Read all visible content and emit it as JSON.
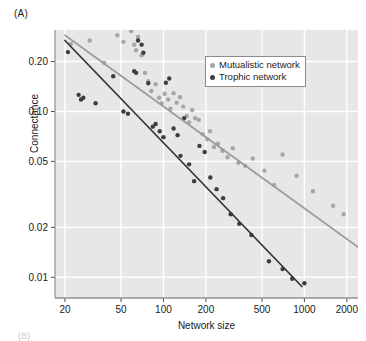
{
  "figure": {
    "panel_label": "(A)",
    "next_panel_stub": "(B)"
  },
  "legend": {
    "position": "top-right-inside",
    "entries": [
      {
        "label": "Mutualistic network",
        "color": "#a6a6a6",
        "marker": "circle"
      },
      {
        "label": "Trophic network",
        "color": "#3d3d3d",
        "marker": "circle"
      }
    ]
  },
  "chart_data": {
    "type": "scatter",
    "title": "",
    "xlabel": "Network size",
    "ylabel": "Connectance",
    "xscale": "log",
    "yscale": "log",
    "xlim": [
      17,
      2400
    ],
    "ylim": [
      0.0075,
      0.31
    ],
    "grid": true,
    "grid_color": "#ffffff",
    "plot_background": "#e7e7e7",
    "xticks": [
      20,
      50,
      100,
      200,
      500,
      1000,
      2000
    ],
    "xticklabels": [
      "20",
      "50",
      "100",
      "200",
      "500",
      "1000",
      "2000"
    ],
    "yticks": [
      0.01,
      0.02,
      0.05,
      0.1,
      0.2
    ],
    "yticklabels": [
      "0.01",
      "0.02",
      "0.05",
      "0.10",
      "0.20"
    ],
    "series": [
      {
        "name": "Mutualistic network",
        "color": "#a6a6a6",
        "marker_size": 4.4,
        "points": [
          [
            22,
            0.255
          ],
          [
            30,
            0.268
          ],
          [
            38,
            0.196
          ],
          [
            47,
            0.288
          ],
          [
            52,
            0.263
          ],
          [
            59,
            0.305
          ],
          [
            62,
            0.253
          ],
          [
            64,
            0.234
          ],
          [
            66,
            0.281
          ],
          [
            70,
            0.218
          ],
          [
            74,
            0.171
          ],
          [
            78,
            0.152
          ],
          [
            82,
            0.133
          ],
          [
            88,
            0.146
          ],
          [
            93,
            0.121
          ],
          [
            97,
            0.112
          ],
          [
            102,
            0.128
          ],
          [
            108,
            0.118
          ],
          [
            112,
            0.104
          ],
          [
            118,
            0.129
          ],
          [
            124,
            0.113
          ],
          [
            131,
            0.122
          ],
          [
            138,
            0.107
          ],
          [
            146,
            0.094
          ],
          [
            152,
            0.086
          ],
          [
            160,
            0.102
          ],
          [
            168,
            0.091
          ],
          [
            178,
            0.089
          ],
          [
            190,
            0.073
          ],
          [
            205,
            0.068
          ],
          [
            214,
            0.076
          ],
          [
            228,
            0.061
          ],
          [
            244,
            0.064
          ],
          [
            262,
            0.058
          ],
          [
            285,
            0.053
          ],
          [
            310,
            0.06
          ],
          [
            340,
            0.049
          ],
          [
            380,
            0.047
          ],
          [
            430,
            0.052
          ],
          [
            520,
            0.044
          ],
          [
            610,
            0.036
          ],
          [
            700,
            0.055
          ],
          [
            880,
            0.041
          ],
          [
            1150,
            0.033
          ],
          [
            1600,
            0.027
          ],
          [
            1900,
            0.024
          ]
        ]
      },
      {
        "name": "Trophic network",
        "color": "#3d3d3d",
        "marker_size": 4.4,
        "points": [
          [
            21,
            0.228
          ],
          [
            25,
            0.126
          ],
          [
            26,
            0.118
          ],
          [
            27,
            0.121
          ],
          [
            33,
            0.112
          ],
          [
            44,
            0.163
          ],
          [
            52,
            0.1
          ],
          [
            56,
            0.097
          ],
          [
            62,
            0.175
          ],
          [
            64,
            0.171
          ],
          [
            66,
            0.268
          ],
          [
            70,
            0.253
          ],
          [
            72,
            0.226
          ],
          [
            78,
            0.148
          ],
          [
            84,
            0.081
          ],
          [
            88,
            0.084
          ],
          [
            94,
            0.076
          ],
          [
            100,
            0.07
          ],
          [
            104,
            0.149
          ],
          [
            110,
            0.158
          ],
          [
            118,
            0.079
          ],
          [
            126,
            0.072
          ],
          [
            132,
            0.054
          ],
          [
            140,
            0.091
          ],
          [
            152,
            0.048
          ],
          [
            165,
            0.038
          ],
          [
            180,
            0.062
          ],
          [
            196,
            0.057
          ],
          [
            215,
            0.04
          ],
          [
            238,
            0.034
          ],
          [
            265,
            0.03
          ],
          [
            300,
            0.024
          ],
          [
            345,
            0.021
          ],
          [
            420,
            0.018
          ],
          [
            560,
            0.0125
          ],
          [
            700,
            0.0112
          ],
          [
            820,
            0.0098
          ],
          [
            1000,
            0.0092
          ]
        ]
      }
    ],
    "trendlines": [
      {
        "name": "Mutualistic network fit",
        "color": "#9a9a9a",
        "x0": 20,
        "y0": 0.288,
        "x1": 2400,
        "y1": 0.0152
      },
      {
        "name": "Trophic network fit",
        "color": "#333333",
        "x0": 20,
        "y0": 0.268,
        "x1": 960,
        "y1": 0.0088
      }
    ]
  }
}
